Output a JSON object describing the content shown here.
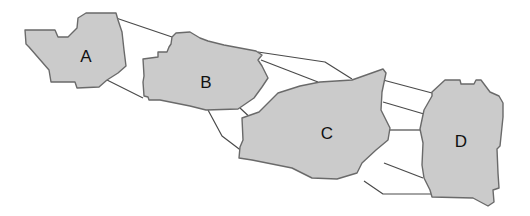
{
  "diagram": {
    "colors": {
      "background": "#ffffff",
      "region_fill": "#cbcbcb",
      "region_stroke": "#6a6a6a",
      "link_stroke": "#4a4a4a",
      "label_color": "#111111"
    },
    "regions": [
      {
        "id": "A",
        "label": "A",
        "label_pos": [
          86,
          58
        ]
      },
      {
        "id": "B",
        "label": "B",
        "label_pos": [
          206,
          84
        ]
      },
      {
        "id": "C",
        "label": "C",
        "label_pos": [
          327,
          135
        ]
      },
      {
        "id": "D",
        "label": "D",
        "label_pos": [
          461,
          143
        ]
      }
    ]
  }
}
